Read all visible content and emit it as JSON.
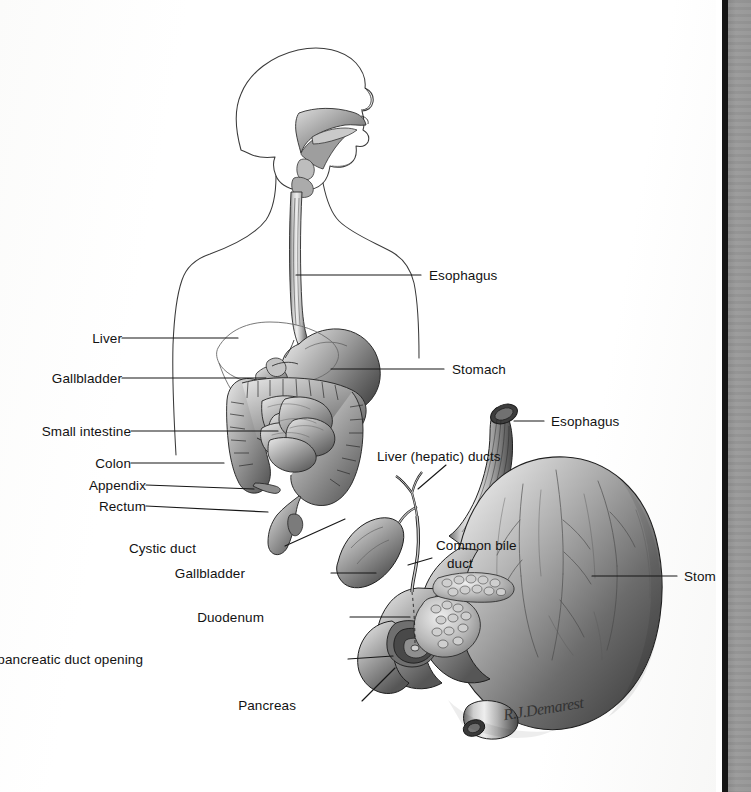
{
  "page": {
    "kind": "scanned-textbook-illustration",
    "background_color": "#ffffff",
    "gutter_color": "#969696",
    "spine_color": "#151515"
  },
  "figure": {
    "artist_signature": "R.J.Demarest",
    "caption": "",
    "panels": [
      {
        "id": "overview",
        "name": "Body outline with gastrointestinal tract"
      },
      {
        "id": "detail",
        "name": "Stomach, duodenum, pancreas and biliary ducts"
      }
    ]
  },
  "labels_overview": [
    {
      "id": "esophagus",
      "text": "Esophagus",
      "x": 429,
      "y": 268,
      "align": "left",
      "lead": "M 421 275 L 296 275"
    },
    {
      "id": "liver",
      "text": "Liver",
      "x": 86,
      "y": 331,
      "align": "right",
      "lead": "M 122 338 L 238 338"
    },
    {
      "id": "stomach",
      "text": "Stomach",
      "x": 452,
      "y": 362,
      "align": "left",
      "lead": "M 444 369 L 331 369"
    },
    {
      "id": "gallbladder",
      "text": "Gallbladder",
      "x": 38,
      "y": 371,
      "align": "right",
      "lead": "M 122 378 L 266 378"
    },
    {
      "id": "small-intestine",
      "text": "Small intestine",
      "x": 33,
      "y": 424,
      "align": "right",
      "lead": "M 131 431 L 278 431"
    },
    {
      "id": "colon",
      "text": "Colon",
      "x": 63,
      "y": 456,
      "align": "right",
      "lead": "M 131 463 L 224 463"
    },
    {
      "id": "appendix",
      "text": "Appendix",
      "x": 78,
      "y": 478,
      "align": "right",
      "lead": "M 146 485 L 254 489"
    },
    {
      "id": "rectum",
      "text": "Rectum",
      "x": 89,
      "y": 499,
      "align": "right",
      "lead": "M 146 506 L 268 511"
    }
  ],
  "labels_detail": [
    {
      "id": "liver-hepatic-ducts",
      "text": "Liver (hepatic) ducts",
      "x": 377,
      "y": 449,
      "align": "left",
      "lead": "M 444 464 L 418 489"
    },
    {
      "id": "esophagus-detail",
      "text": "Esophagus",
      "x": 551,
      "y": 414,
      "align": "left",
      "lead": "M 544 421 L 514 421"
    },
    {
      "id": "cystic-duct",
      "text": "Cystic duct",
      "x": 196,
      "y": 541,
      "align": "right",
      "lead": "M 285 546 L 342 520"
    },
    {
      "id": "common-bile-duct-line1",
      "text": "Common bile",
      "x": 436,
      "y": 538,
      "align": "left",
      "lead": "M 430 558 L 404 566"
    },
    {
      "id": "common-bile-duct-line2",
      "text": "duct",
      "x": 447,
      "y": 555,
      "align": "left",
      "lead": ""
    },
    {
      "id": "gallbladder-detail",
      "text": "Gallbladder",
      "x": 245,
      "y": 566,
      "align": "right",
      "lead": "M 331 573 L 378 573"
    },
    {
      "id": "stomach-detail",
      "text": "Stomach",
      "x": 684,
      "y": 569,
      "align": "left",
      "lead": "M 677 576 L 591 576"
    },
    {
      "id": "duodenum",
      "text": "Duodenum",
      "x": 264,
      "y": 610,
      "align": "right",
      "lead": "M 350 617 L 408 617"
    },
    {
      "id": "bile-pancreatic-opening",
      "text": "Bile/pancreatic duct opening",
      "x": 143,
      "y": 652,
      "align": "right",
      "lead": "M 348 659 L 392 659"
    },
    {
      "id": "pancreas",
      "text": "Pancreas",
      "x": 296,
      "y": 698,
      "align": "right",
      "lead": "M 362 703 L 394 670"
    }
  ],
  "colors": {
    "ink": "#121212",
    "lead_line": "#171717",
    "outline": "#3a3a3a",
    "organ_light": "#d9d9d9",
    "organ_mid": "#9b9b9b",
    "organ_dark": "#4a4a4a"
  }
}
